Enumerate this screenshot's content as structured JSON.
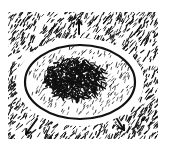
{
  "illustration": {
    "subject": "hand-drawn oval with dark hatched core, white halo ring, hatched surroundings and three outward arrows",
    "colors": {
      "ink": "#111111",
      "paper": "#ffffff"
    },
    "background_region": {
      "x": 8,
      "y": 12,
      "w": 150,
      "h": 127
    },
    "halo": {
      "cx": 80,
      "cy": 82,
      "rx": 64,
      "ry": 44
    },
    "oval": {
      "cx": 80,
      "cy": 82,
      "rx": 55,
      "ry": 37,
      "stroke_width": 2.2
    },
    "core": {
      "cx": 75,
      "cy": 78,
      "rx": 30,
      "ry": 21
    },
    "arrows": [
      {
        "name": "arrow-up",
        "x1": 79,
        "y1": 34,
        "x2": 79,
        "y2": 20
      },
      {
        "name": "arrow-down-left",
        "x1": 37,
        "y1": 119,
        "x2": 26,
        "y2": 134
      },
      {
        "name": "arrow-down-right",
        "x1": 117,
        "y1": 119,
        "x2": 124,
        "y2": 130
      }
    ]
  }
}
